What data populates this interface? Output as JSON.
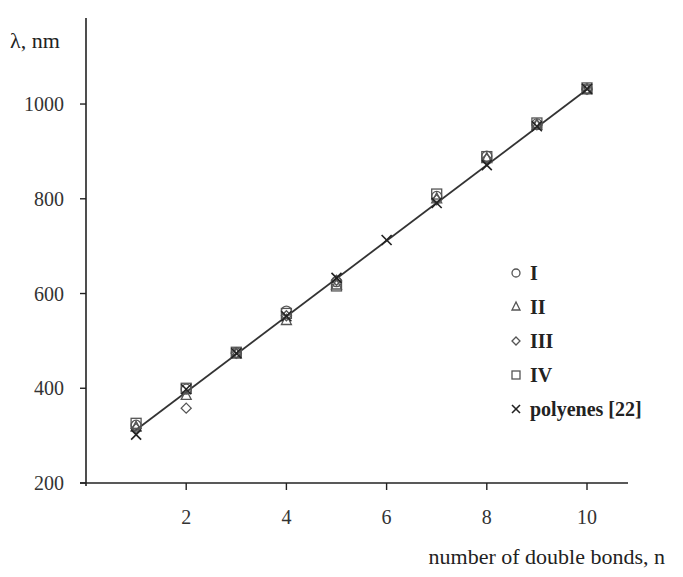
{
  "chart_data": {
    "type": "scatter",
    "title": "",
    "xlabel": "number of double bonds, n",
    "ylabel": "λ, nm",
    "xlim": [
      0,
      10.8
    ],
    "ylim": [
      200,
      1130
    ],
    "xticks": [
      2,
      4,
      6,
      8,
      10
    ],
    "yticks": [
      200,
      400,
      600,
      800,
      1000
    ],
    "grid": false,
    "legend_position": "right-middle",
    "series": [
      {
        "name": "I",
        "marker": "circle",
        "points": [
          [
            1,
            322
          ],
          [
            2,
            398
          ],
          [
            3,
            475
          ],
          [
            4,
            563
          ],
          [
            5,
            625
          ],
          [
            7,
            805
          ],
          [
            8,
            890
          ],
          [
            9,
            958
          ],
          [
            10,
            1032
          ]
        ]
      },
      {
        "name": "II",
        "marker": "triangle",
        "points": [
          [
            1,
            318
          ],
          [
            2,
            385
          ],
          [
            3,
            472
          ],
          [
            4,
            543
          ],
          [
            5,
            618
          ],
          [
            7,
            800
          ],
          [
            8,
            885
          ],
          [
            9,
            955
          ],
          [
            10,
            1030
          ]
        ]
      },
      {
        "name": "III",
        "marker": "diamond",
        "points": [
          [
            1,
            315
          ],
          [
            2,
            358
          ],
          [
            3,
            474
          ],
          [
            4,
            553
          ],
          [
            5,
            628
          ],
          [
            7,
            798
          ],
          [
            8,
            884
          ],
          [
            9,
            956
          ],
          [
            10,
            1031
          ]
        ]
      },
      {
        "name": "IV",
        "marker": "square",
        "points": [
          [
            1,
            326
          ],
          [
            2,
            400
          ],
          [
            3,
            476
          ],
          [
            4,
            558
          ],
          [
            5,
            616
          ],
          [
            7,
            810
          ],
          [
            8,
            889
          ],
          [
            9,
            960
          ],
          [
            10,
            1034
          ]
        ]
      },
      {
        "name": "polyenes [22]",
        "marker": "x",
        "points": [
          [
            1,
            302
          ],
          [
            2,
            398
          ],
          [
            3,
            474
          ],
          [
            4,
            552
          ],
          [
            5,
            633
          ],
          [
            6,
            713
          ],
          [
            7,
            791
          ],
          [
            8,
            871
          ],
          [
            9,
            953
          ],
          [
            10,
            1032
          ]
        ]
      }
    ],
    "fit_line": {
      "x": [
        0.95,
        10.05
      ],
      "y": [
        308,
        1035
      ]
    }
  },
  "axes": {
    "y_title": "λ, nm",
    "x_title": "number of double bonds, n",
    "x_tick_labels": [
      "2",
      "4",
      "6",
      "8",
      "10"
    ],
    "y_tick_labels": [
      "200",
      "400",
      "600",
      "800",
      "1000"
    ]
  },
  "legend": [
    {
      "label": "I",
      "marker": "circle"
    },
    {
      "label": "II",
      "marker": "triangle"
    },
    {
      "label": "III",
      "marker": "diamond"
    },
    {
      "label": "IV",
      "marker": "square"
    },
    {
      "label": "polyenes [22]",
      "marker": "x"
    }
  ]
}
